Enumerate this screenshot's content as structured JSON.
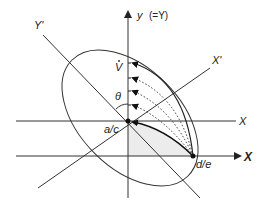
{
  "diagram": {
    "labels": {
      "y_axis": "y",
      "y_axis_eq": "(=Y)",
      "y_prime": "Y'",
      "x_prime": "X'",
      "x_upper": "X",
      "x_lower": "X",
      "v_dot": "V",
      "theta": "θ",
      "origin": "a/c",
      "point_de": "d/e"
    },
    "colors": {
      "line": "#333333",
      "shade": "#ececec",
      "background": "#ffffff"
    },
    "elements": [
      "rotated ellipse",
      "vertical y axis with arrow",
      "upper horizontal X line through a/c",
      "lower horizontal X axis with arrow through d/e",
      "rotated Y' axis",
      "rotated X' axis",
      "solid curved arrow from d/e to a/c",
      "dotted curved arrows from d/e to points on y axis",
      "outer solid curved arrow to V",
      "shaded region between a/c, d/e and lower axis",
      "angle arc theta between y axis and Y'"
    ]
  }
}
